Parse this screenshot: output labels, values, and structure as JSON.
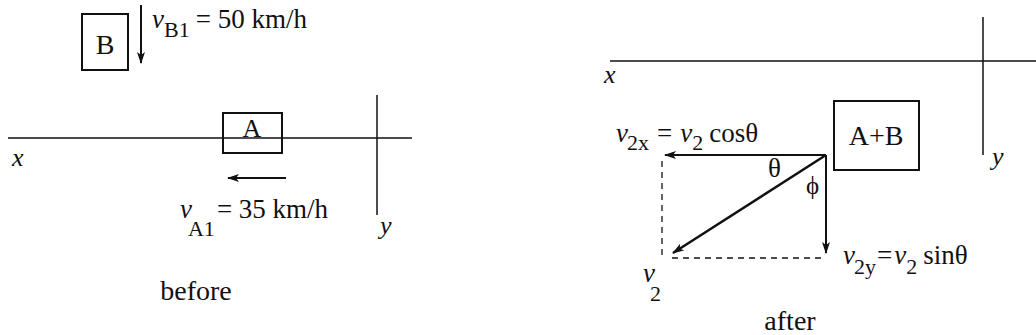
{
  "diagram": {
    "type": "physics-collision-vector-diagram",
    "stroke_color": "#111111",
    "background": "#ffffff"
  },
  "before": {
    "caption": "before",
    "box_b": {
      "label": "B"
    },
    "box_a": {
      "label": "A"
    },
    "velocity_b": {
      "symbol": "v",
      "subscript": "B1",
      "equals": "= 50 km/h"
    },
    "velocity_a": {
      "symbol": "v",
      "subscript": "A1",
      "equals": "= 35 km/h"
    },
    "axes": {
      "x_label": "x",
      "y_label": "y"
    }
  },
  "after": {
    "caption": "after",
    "box_ab": {
      "label": "A+B"
    },
    "v2x": {
      "symbol": "v",
      "subscript": "2x",
      "rhs_symbol": "v",
      "rhs_subscript": "2",
      "rhs_func": "cosθ",
      "equals": "="
    },
    "v2y": {
      "symbol": "v",
      "subscript": "2y",
      "rhs_symbol": "v",
      "rhs_subscript": "2",
      "rhs_func": "sinθ",
      "equals": "="
    },
    "v2": {
      "symbol": "v",
      "subscript": "2"
    },
    "angles": {
      "theta": "θ",
      "phi": "ϕ"
    },
    "axes": {
      "x_label": "x",
      "y_label": "y"
    }
  }
}
